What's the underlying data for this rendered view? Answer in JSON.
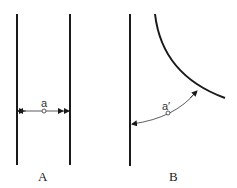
{
  "panels": [
    {
      "caption": "A",
      "measure_label": "a"
    },
    {
      "caption": "B",
      "measure_label": "a′"
    }
  ],
  "colors": {
    "stroke": "#1a1a1a",
    "text": "#222222"
  }
}
